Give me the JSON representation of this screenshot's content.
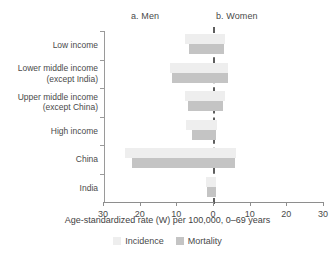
{
  "panels": {
    "left_title": "a. Men",
    "right_title": "b. Women"
  },
  "legend": {
    "incidence_label": "Incidence",
    "mortality_label": "Mortality",
    "incidence_color": "#eeeeee",
    "mortality_color": "#c4c4c4",
    "position": "bottom-center"
  },
  "axis": {
    "x_title": "Age-standardized rate (W) per 100,000, 0–69 years",
    "x_ticks": [
      "30",
      "20",
      "10",
      "0",
      "10",
      "20",
      "30"
    ],
    "x_tick_values": [
      30,
      20,
      10,
      0,
      10,
      20,
      30
    ],
    "x_max": 30,
    "grid": false,
    "zero_line": "dashed"
  },
  "categories": [
    {
      "line1": "Low income",
      "line2": ""
    },
    {
      "line1": "Lower middle income",
      "line2": "(except India)"
    },
    {
      "line1": "Upper middle income",
      "line2": "(except China)"
    },
    {
      "line1": "High income",
      "line2": ""
    },
    {
      "line1": "China",
      "line2": ""
    },
    {
      "line1": "India",
      "line2": ""
    }
  ],
  "chart_data": {
    "type": "bar",
    "title": "",
    "subtitle": "",
    "orientation": "horizontal",
    "layout": "back-to-back bidirectional (men left of zero, women right of zero)",
    "xlabel": "Age-standardized rate (W) per 100,000, 0–69 years",
    "ylabel": "",
    "xlim": [
      -30,
      30
    ],
    "xticks": [
      30,
      20,
      10,
      0,
      10,
      20,
      30
    ],
    "grid": false,
    "legend": [
      "Incidence",
      "Mortality"
    ],
    "categories": [
      "Low income",
      "Lower middle income (except India)",
      "Upper middle income (except China)",
      "High income",
      "China",
      "India"
    ],
    "series": [
      {
        "name": "Men Incidence",
        "panel": "a. Men",
        "metric": "Incidence",
        "values": [
          7.5,
          11.8,
          7.6,
          7.4,
          24.0,
          1.9
        ]
      },
      {
        "name": "Men Mortality",
        "panel": "a. Men",
        "metric": "Mortality",
        "values": [
          6.5,
          11.2,
          6.8,
          5.7,
          22.0,
          1.7
        ]
      },
      {
        "name": "Women Incidence",
        "panel": "b. Women",
        "metric": "Incidence",
        "values": [
          3.2,
          4.2,
          3.3,
          1.1,
          6.2,
          0.9
        ]
      },
      {
        "name": "Women Mortality",
        "panel": "b. Women",
        "metric": "Mortality",
        "values": [
          3.0,
          4.1,
          2.8,
          0.9,
          6.0,
          0.8
        ]
      }
    ]
  }
}
